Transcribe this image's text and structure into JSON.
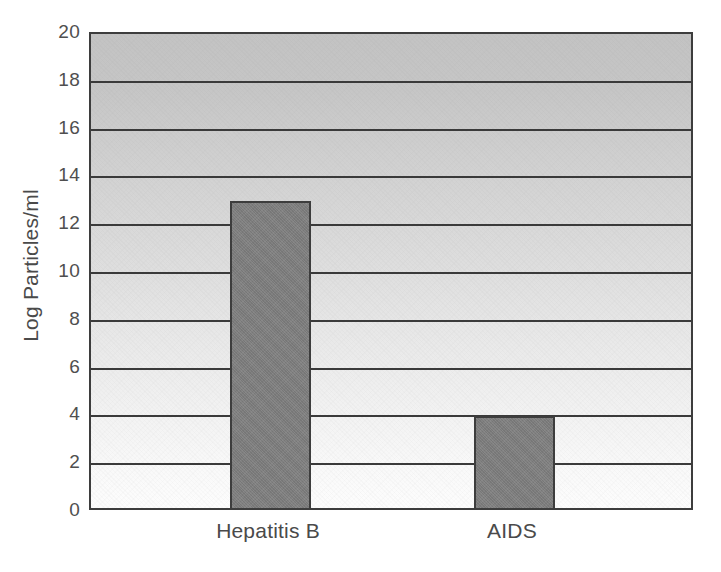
{
  "chart_data": {
    "type": "bar",
    "title": "",
    "subtitle": "",
    "xlabel": "",
    "ylabel": "Log Particles/ml",
    "categories": [
      "Hepatitis B",
      "AIDS"
    ],
    "values": [
      13,
      4
    ],
    "series": [
      {
        "name": "Log Particles/ml",
        "values": [
          13,
          4
        ]
      }
    ],
    "ylim": [
      0,
      20
    ],
    "ytick_labels": [
      "0",
      "2",
      "4",
      "6",
      "8",
      "10",
      "12",
      "14",
      "16",
      "18",
      "20"
    ],
    "ytick_values": [
      0,
      2,
      4,
      6,
      8,
      10,
      12,
      14,
      16,
      18,
      20
    ],
    "ytick_step": 2,
    "grid": true,
    "grid_axis": "y",
    "legend": false,
    "legend_position": "none",
    "annotations": [],
    "colors": {
      "bar_fill": "#7e7e7e",
      "bar_border": "#3d3d3d",
      "gridline": "#3a3a3a",
      "axis": "#3d3d3d",
      "plot_bg_top": "#c3c3c3",
      "plot_bg_bottom": "#fdfdfd",
      "text": "#4a4a4a",
      "figure_bg": "#ffffff"
    }
  },
  "figure": {
    "y_axis_label": "Log Particles/ml"
  }
}
